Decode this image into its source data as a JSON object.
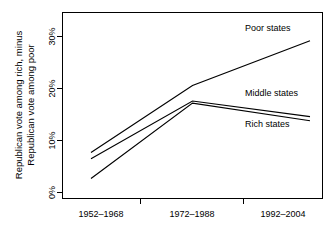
{
  "chart_data": {
    "type": "line",
    "title": "",
    "xlabel": "",
    "ylabel_line1": "Republican vote among rich, minus",
    "ylabel_line2": "Republican vote among poor",
    "categories": [
      "1952–1968",
      "1972–1988",
      "1992–2004"
    ],
    "ytick_labels": [
      "0%",
      "10%",
      "20%",
      "30%"
    ],
    "ytick_values": [
      0,
      10,
      20,
      30
    ],
    "ylim": [
      -1,
      32
    ],
    "grid": false,
    "legend_position": "inline-right",
    "series": [
      {
        "name": "Poor states",
        "label": "Poor states",
        "values": [
          7.7,
          20.6,
          29.2
        ]
      },
      {
        "name": "Middle states",
        "label": "Middle states",
        "values": [
          6.5,
          17.6,
          14.6
        ]
      },
      {
        "name": "Rich states",
        "label": "Rich states",
        "values": [
          2.7,
          17.2,
          13.8
        ]
      }
    ]
  },
  "axis": {
    "ytick_0": "0%",
    "ytick_1": "10%",
    "ytick_2": "20%",
    "ytick_3": "30%",
    "xtick_0": "1952–1968",
    "xtick_1": "1972–1988",
    "xtick_2": "1992–2004",
    "ylabel_line1": "Republican vote among rich, minus",
    "ylabel_line2": "Republican vote among poor"
  },
  "annotations": {
    "poor": "Poor states",
    "middle": "Middle states",
    "rich": "Rich states"
  },
  "colors": {
    "line": "#000000",
    "frame": "#000000",
    "background": "#ffffff"
  }
}
